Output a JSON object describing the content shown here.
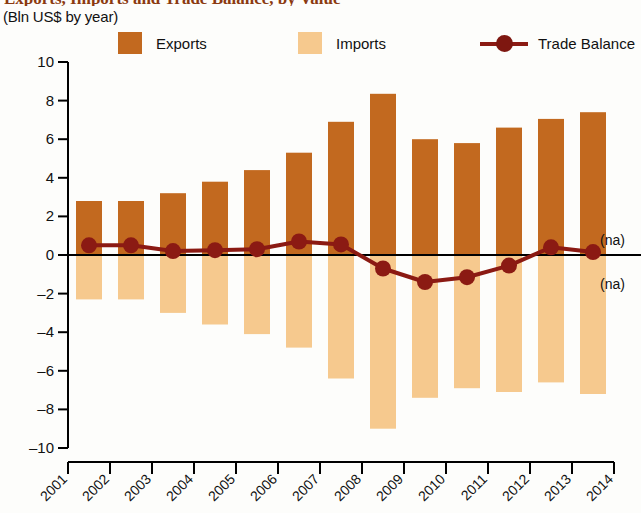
{
  "header": {
    "title": "Exports, Imports and Trade Balance, by Value",
    "subtitle": "(Bln US$ by year)"
  },
  "legend": {
    "exports_label": "Exports",
    "imports_label": "Imports",
    "balance_label": "Trade Balance"
  },
  "annotations": {
    "na_upper": "(na)",
    "na_lower": "(na)"
  },
  "colors": {
    "exports": "#C2691F",
    "imports": "#F6C98E",
    "balance": "#8B1A13",
    "axis": "#000000",
    "title": "#8B3A10"
  },
  "chart_data": {
    "type": "bar",
    "title": "Exports, Imports and Trade Balance, by Value",
    "subtitle": "(Bln US$ by year)",
    "xlabel": "",
    "ylabel": "",
    "ylim": [
      -10,
      10
    ],
    "ytick_labels": [
      "10",
      "8",
      "6",
      "4",
      "2",
      "0",
      "-2",
      "-4",
      "-6",
      "-8",
      "-10"
    ],
    "ytick_values": [
      10,
      8,
      6,
      4,
      2,
      0,
      -2,
      -4,
      -6,
      -8,
      -10
    ],
    "grid": false,
    "legend_position": "top",
    "categories": [
      "2001",
      "2002",
      "2003",
      "2004",
      "2005",
      "2006",
      "2007",
      "2008",
      "2009",
      "2010",
      "2011",
      "2012",
      "2013"
    ],
    "xtick_labels": [
      "2001",
      "2002",
      "2003",
      "2004",
      "2005",
      "2006",
      "2007",
      "2008",
      "2009",
      "2010",
      "2011",
      "2012",
      "2013",
      "2014"
    ],
    "series": [
      {
        "name": "Exports",
        "type": "bar",
        "color": "#C2691F",
        "values": [
          2.8,
          2.8,
          3.2,
          3.8,
          4.4,
          5.3,
          6.9,
          8.35,
          6.0,
          5.8,
          6.6,
          7.05,
          7.4
        ]
      },
      {
        "name": "Imports",
        "type": "bar",
        "color": "#F6C98E",
        "values": [
          -2.3,
          -2.3,
          -3.0,
          -3.6,
          -4.1,
          -4.8,
          -6.4,
          -9.0,
          -7.4,
          -6.9,
          -7.1,
          -6.6,
          -7.2
        ]
      },
      {
        "name": "Trade Balance",
        "type": "line",
        "color": "#8B1A13",
        "values": [
          0.5,
          0.5,
          0.2,
          0.25,
          0.3,
          0.7,
          0.55,
          -0.7,
          -1.4,
          -1.15,
          -0.55,
          0.4,
          0.15
        ]
      }
    ]
  }
}
